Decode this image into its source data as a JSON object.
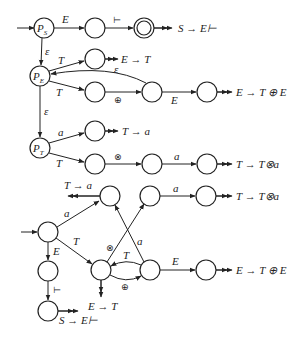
{
  "diagram": {
    "top_automaton": {
      "states": {
        "PS": {
          "label": "P",
          "sub": "S"
        },
        "PE": {
          "label": "P",
          "sub": "E"
        },
        "PT": {
          "label": "P",
          "sub": "T"
        }
      },
      "edge_labels": {
        "ps_to_n1": "E",
        "n1_to_final": "⊢",
        "ps_to_pe": "ε",
        "pe_to_nt1": "T",
        "pe_to_nt2": "T",
        "nt2_to_nplus": "⊕",
        "nplus_to_pe": "ε",
        "nplus_to_ne": "E",
        "pe_to_pt": "ε",
        "pt_to_na": "a",
        "pt_to_nt3": "T",
        "nt3_to_ntimes": "⊗",
        "ntimes_to_na2": "a"
      },
      "reductions": {
        "final": "S → E⊢",
        "nt1": "E → T",
        "ne": "E → T ⊕ E",
        "na": "T → a",
        "na2": "T → T⊗a"
      }
    },
    "bottom_automaton": {
      "edge_labels": {
        "start_to_na": "a",
        "start_to_nt": "T",
        "start_to_ne": "E",
        "ne_to_final": "⊢",
        "nt_to_ntimes": "⊗",
        "nplus_to_na": "a",
        "nplus_to_nt": "T",
        "nt_to_nplus": "⊕",
        "ntimes_to_na2": "a",
        "nplus_to_ne2": "E"
      },
      "reductions": {
        "na": "T → a",
        "na2": "T → T⊗a",
        "nt": "E → T",
        "ne2": "E → T ⊕ E",
        "final": "S → E⊢"
      }
    }
  }
}
